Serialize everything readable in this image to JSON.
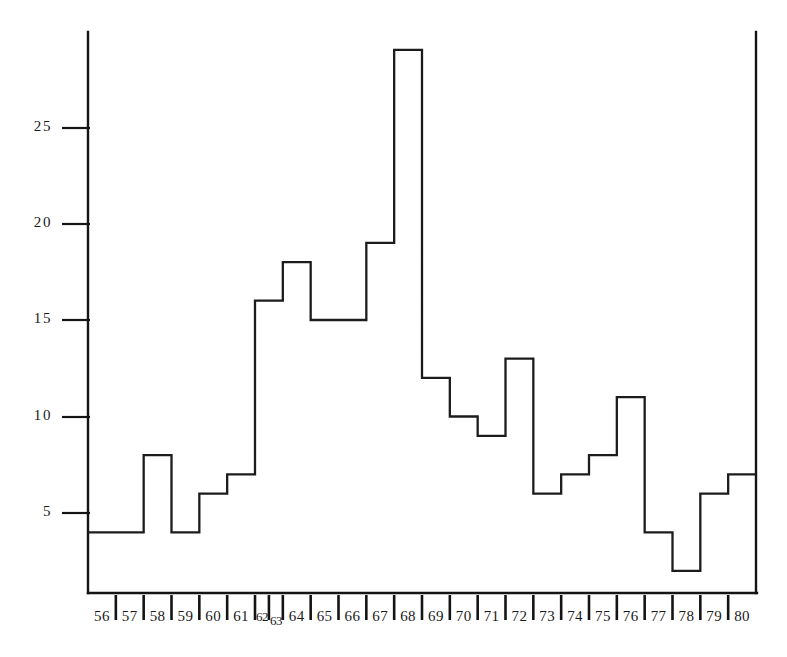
{
  "chart_data": {
    "type": "bar",
    "subtype": "step-histogram",
    "title": "",
    "subtitle": "",
    "xlabel": "",
    "ylabel": "",
    "categories": [
      "56",
      "57",
      "58",
      "59",
      "60",
      "61",
      "62",
      "63",
      "64",
      "65",
      "66",
      "67",
      "68",
      "69",
      "70",
      "71",
      "72",
      "73",
      "74",
      "75",
      "76",
      "77",
      "78",
      "79",
      "80"
    ],
    "values": [
      4,
      4,
      8,
      4,
      6,
      7,
      16,
      16,
      18,
      15,
      15,
      19,
      29,
      12,
      10,
      9,
      13,
      6,
      7,
      8,
      11,
      4,
      2,
      6,
      7
    ],
    "ylim": [
      0,
      30
    ],
    "xlim_labels": [
      "56",
      "80"
    ],
    "ytick_labels": [
      "5",
      "10",
      "15",
      "20",
      "25"
    ],
    "ytick_values": [
      5,
      10,
      15,
      20,
      25
    ],
    "grid": false,
    "legend": null,
    "legend_position": "none",
    "series": [
      {
        "name": "count",
        "values": [
          4,
          4,
          8,
          4,
          6,
          7,
          16,
          16,
          18,
          15,
          15,
          19,
          29,
          12,
          10,
          9,
          13,
          6,
          7,
          8,
          11,
          4,
          2,
          6,
          7
        ]
      }
    ],
    "annotations": [],
    "colors": {
      "line": "#1c1c1c",
      "axis": "#141414",
      "background": "#ffffff",
      "text": "#1a1a1a"
    }
  },
  "figure": {
    "caption": "",
    "axis_name_x": "x-axis-years",
    "axis_name_y": "y-axis-counts"
  }
}
